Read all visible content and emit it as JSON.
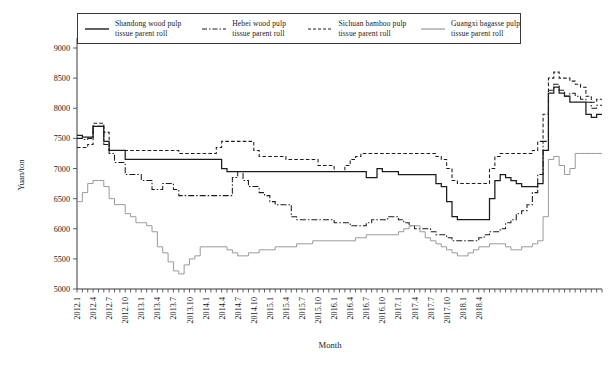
{
  "chart_data": {
    "type": "line",
    "title": "",
    "xlabel": "Month",
    "ylabel": "Yuan/ton",
    "ylim": [
      5000,
      9000
    ],
    "ytick_step": 500,
    "yticks": [
      5000,
      5500,
      6000,
      6500,
      7000,
      7500,
      8000,
      8500,
      9000
    ],
    "grid": false,
    "legend_position": "top",
    "x_start": "2012.1",
    "x_end": "2018.6",
    "x_interval": "monthly",
    "xticks": [
      "2012.1",
      "2012.4",
      "2012.7",
      "2012.10",
      "2013.1",
      "2013.4",
      "2013.7",
      "2013.10",
      "2014.1",
      "2014.4",
      "2014.7",
      "2014.10",
      "2015.1",
      "2015.4",
      "2015.7",
      "2015.10",
      "2016.1",
      "2016.4",
      "2016.7",
      "2016.10",
      "2017.1",
      "2017.4",
      "2017.7",
      "2017.10",
      "2018.1",
      "2018.4"
    ],
    "series": [
      {
        "name": "Shandong wood pulp tissue parent roll",
        "style": "solid",
        "color": "#1c1c1c",
        "values": [
          7550,
          7520,
          7520,
          7700,
          7700,
          7450,
          7300,
          7300,
          7300,
          7150,
          7150,
          7150,
          7150,
          7150,
          7150,
          7150,
          7150,
          7150,
          7150,
          7150,
          7150,
          7150,
          7150,
          7150,
          7150,
          7150,
          7150,
          7000,
          6950,
          6950,
          6950,
          6950,
          6950,
          6950,
          6950,
          6950,
          6950,
          6950,
          6950,
          6950,
          6950,
          6950,
          6950,
          6950,
          6950,
          6950,
          6950,
          6950,
          6950,
          6950,
          6950,
          6950,
          6950,
          6950,
          6850,
          6850,
          7000,
          6950,
          6950,
          6950,
          6900,
          6900,
          6900,
          6900,
          6900,
          6900,
          6900,
          6750,
          6700,
          6450,
          6200,
          6150,
          6150,
          6150,
          6150,
          6150,
          6150,
          6500,
          6800,
          6900,
          6850,
          6800,
          6750,
          6700,
          6700,
          6700,
          6750,
          7300,
          8250,
          8350,
          8250,
          8200,
          8100,
          8100,
          8100,
          7900,
          7850,
          7900,
          7900
        ]
      },
      {
        "name": "Hebei wood pulp tissue parent roll",
        "style": "dash-dot",
        "color": "#1c1c1c",
        "values": [
          7500,
          7480,
          7500,
          7700,
          7700,
          7400,
          7250,
          7100,
          7100,
          6900,
          6900,
          6900,
          6800,
          6800,
          6650,
          6650,
          6750,
          6750,
          6650,
          6550,
          6550,
          6550,
          6550,
          6550,
          6550,
          6550,
          6550,
          6550,
          6550,
          6850,
          6950,
          6800,
          6700,
          6700,
          6600,
          6550,
          6450,
          6400,
          6400,
          6400,
          6200,
          6150,
          6150,
          6150,
          6150,
          6150,
          6150,
          6150,
          6100,
          6100,
          6100,
          6050,
          6050,
          6050,
          6100,
          6150,
          6150,
          6150,
          6200,
          6200,
          6150,
          6100,
          6050,
          6000,
          6000,
          6000,
          5950,
          5900,
          5900,
          5850,
          5800,
          5800,
          5800,
          5800,
          5800,
          5850,
          5900,
          5950,
          5950,
          6000,
          6100,
          6150,
          6250,
          6300,
          6400,
          6600,
          6900,
          7450,
          8300,
          8400,
          8300,
          8200,
          8250,
          8200,
          8150,
          8100,
          8000,
          8050,
          8050
        ]
      },
      {
        "name": "Sichuan bamboo pulp tissue parent roll",
        "style": "dashed",
        "color": "#1c1c1c",
        "values": [
          7350,
          7350,
          7400,
          7750,
          7750,
          7600,
          7300,
          7300,
          7300,
          7300,
          7300,
          7300,
          7300,
          7300,
          7300,
          7300,
          7300,
          7300,
          7300,
          7250,
          7250,
          7250,
          7250,
          7250,
          7250,
          7250,
          7350,
          7450,
          7450,
          7450,
          7450,
          7450,
          7450,
          7300,
          7200,
          7200,
          7200,
          7200,
          7200,
          7150,
          7150,
          7150,
          7150,
          7150,
          7150,
          7050,
          7050,
          7050,
          6950,
          6950,
          7050,
          7150,
          7200,
          7250,
          7250,
          7250,
          7250,
          7250,
          7250,
          7250,
          7250,
          7250,
          7250,
          7250,
          7250,
          7250,
          7250,
          7200,
          7150,
          7000,
          6800,
          6750,
          6750,
          6750,
          6750,
          6750,
          6750,
          7000,
          7200,
          7250,
          7250,
          7250,
          7250,
          7250,
          7250,
          7300,
          7450,
          7900,
          8500,
          8600,
          8500,
          8500,
          8450,
          8400,
          8350,
          8200,
          8100,
          8150,
          8150
        ]
      },
      {
        "name": "Guangxi bagasse pulp tissue parent roll",
        "style": "solid-gray",
        "color": "#9a9a9a",
        "values": [
          6450,
          6600,
          6750,
          6800,
          6800,
          6700,
          6500,
          6400,
          6400,
          6250,
          6200,
          6100,
          6100,
          6050,
          5950,
          5700,
          5600,
          5450,
          5300,
          5250,
          5400,
          5500,
          5550,
          5700,
          5700,
          5700,
          5700,
          5700,
          5650,
          5600,
          5550,
          5550,
          5600,
          5600,
          5650,
          5650,
          5650,
          5700,
          5700,
          5700,
          5700,
          5750,
          5750,
          5750,
          5800,
          5800,
          5800,
          5800,
          5800,
          5800,
          5800,
          5800,
          5850,
          5850,
          5900,
          5900,
          5900,
          5900,
          5900,
          5900,
          5950,
          6000,
          6050,
          6050,
          5950,
          5850,
          5800,
          5750,
          5700,
          5650,
          5600,
          5550,
          5550,
          5600,
          5650,
          5700,
          5700,
          5750,
          5750,
          5750,
          5700,
          5650,
          5650,
          5700,
          5700,
          5750,
          5800,
          6200,
          7150,
          7200,
          7050,
          6900,
          7000,
          7250,
          7250,
          7250,
          7250,
          7250,
          7250
        ]
      }
    ]
  },
  "legend": {
    "entries": [
      {
        "line1": "Shandong wood pulp",
        "line2": "tissue parent roll",
        "icon": "solid-line-icon"
      },
      {
        "line1": "Hebei wood pulp",
        "line2": "tissue parent roll",
        "icon": "dash-dot-line-icon"
      },
      {
        "line1": "Sichuan bamboo pulp",
        "line2": "tissue parent roll",
        "icon": "dashed-line-icon"
      },
      {
        "line1": "Guangxi bagasse pulp",
        "line2": "tissue parent roll",
        "icon": "gray-line-icon"
      }
    ]
  },
  "axes": {
    "y_title": "Yuan/ton",
    "x_title": "Month"
  }
}
